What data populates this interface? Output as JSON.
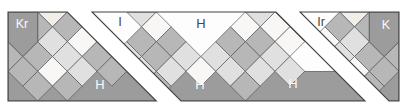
{
  "figure": {
    "width": 407,
    "height": 110,
    "strip": {
      "x": 8,
      "y": 12,
      "w": 391,
      "h": 89
    },
    "unit": 14.8333,
    "colors": {
      "dark": "#9c9c9c",
      "med": "#b7b7b7",
      "light": "#e0e0e0",
      "white": "#f8f7f5",
      "cream": "#f0eee6",
      "sky": "#fdfdfd",
      "cellStroke": "#54565a",
      "segStroke": "#404244",
      "labelLight": "#fafafa",
      "labelDark": "#474747"
    },
    "segments": [
      {
        "name": "segment-left",
        "clip": [
          [
            0,
            0
          ],
          [
            59.33,
            0
          ],
          [
            148.33,
            89
          ],
          [
            0,
            89
          ]
        ],
        "pentagons": [
          {
            "name": "corner-piece-Kr",
            "mirror": false,
            "pts": [
              [
                0,
                0
              ],
              [
                2,
                0
              ],
              [
                2,
                2
              ],
              [
                1,
                3
              ],
              [
                0,
                2
              ]
            ],
            "col": "dark"
          }
        ],
        "cells": [
          {
            "t": "tf",
            "c": 3,
            "r": 0,
            "col": "cream",
            "mirror": false
          },
          {
            "t": "tr",
            "c": 2,
            "r": 1,
            "col": "med",
            "mirror": false
          },
          {
            "t": "tr",
            "c": 0,
            "r": 3,
            "col": "med",
            "mirror": false
          },
          {
            "t": "d",
            "c": 4,
            "r": 1,
            "col": "med",
            "mirror": false
          },
          {
            "t": "d",
            "c": 3,
            "r": 2,
            "col": "light",
            "mirror": false
          },
          {
            "t": "d",
            "c": 5,
            "r": 2,
            "col": "white",
            "mirror": false
          },
          {
            "t": "d",
            "c": 2,
            "r": 3,
            "col": "med",
            "mirror": false
          },
          {
            "t": "d",
            "c": 4,
            "r": 3,
            "col": "light",
            "mirror": false
          },
          {
            "t": "d",
            "c": 6,
            "r": 3,
            "col": "med",
            "mirror": false
          },
          {
            "t": "d",
            "c": 1,
            "r": 4,
            "col": "med",
            "mirror": false
          },
          {
            "t": "d",
            "c": 3,
            "r": 4,
            "col": "white",
            "mirror": false
          },
          {
            "t": "d",
            "c": 5,
            "r": 4,
            "col": "light",
            "mirror": false
          },
          {
            "t": "d",
            "c": 7,
            "r": 4,
            "col": "med",
            "mirror": false
          },
          {
            "t": "d",
            "c": 2,
            "r": 5,
            "col": "med",
            "mirror": false
          },
          {
            "t": "d",
            "c": 4,
            "r": 5,
            "col": "med",
            "mirror": false
          }
        ]
      },
      {
        "name": "segment-middle",
        "clip": [
          [
            84,
            0
          ],
          [
            268,
            0
          ],
          [
            357,
            89
          ],
          [
            173,
            89
          ]
        ],
        "pentagons": [],
        "cells": [
          {
            "t": "tf",
            "c": 9,
            "r": 0,
            "col": "light",
            "mirror": false
          },
          {
            "t": "tf",
            "c": 17,
            "r": 0,
            "col": "light",
            "mirror": false
          },
          {
            "t": "d",
            "c": 10,
            "r": 1,
            "col": "white",
            "mirror": false
          },
          {
            "t": "d",
            "c": 16,
            "r": 1,
            "col": "white",
            "mirror": false
          },
          {
            "t": "d",
            "c": 18,
            "r": 1,
            "col": "white",
            "mirror": false
          },
          {
            "t": "d",
            "c": 9,
            "r": 2,
            "col": "med",
            "mirror": false
          },
          {
            "t": "d",
            "c": 11,
            "r": 2,
            "col": "med",
            "mirror": false
          },
          {
            "t": "d",
            "c": 15,
            "r": 2,
            "col": "med",
            "mirror": false
          },
          {
            "t": "d",
            "c": 17,
            "r": 2,
            "col": "med",
            "mirror": false
          },
          {
            "t": "d",
            "c": 19,
            "r": 2,
            "col": "white",
            "mirror": false
          },
          {
            "t": "d",
            "c": 8,
            "r": 3,
            "col": "light",
            "mirror": false
          },
          {
            "t": "d",
            "c": 10,
            "r": 3,
            "col": "med",
            "mirror": false
          },
          {
            "t": "d",
            "c": 12,
            "r": 3,
            "col": "light",
            "mirror": false
          },
          {
            "t": "d",
            "c": 14,
            "r": 3,
            "col": "light",
            "mirror": false
          },
          {
            "t": "d",
            "c": 16,
            "r": 3,
            "col": "med",
            "mirror": false
          },
          {
            "t": "d",
            "c": 18,
            "r": 3,
            "col": "light",
            "mirror": false
          },
          {
            "t": "d",
            "c": 9,
            "r": 4,
            "col": "light",
            "mirror": false
          },
          {
            "t": "d",
            "c": 11,
            "r": 4,
            "col": "light",
            "mirror": false
          },
          {
            "t": "d",
            "c": 13,
            "r": 4,
            "col": "white",
            "mirror": false
          },
          {
            "t": "d",
            "c": 15,
            "r": 4,
            "col": "light",
            "mirror": false
          },
          {
            "t": "d",
            "c": 17,
            "r": 4,
            "col": "light",
            "mirror": false
          },
          {
            "t": "d",
            "c": 19,
            "r": 4,
            "col": "light",
            "mirror": false
          },
          {
            "t": "d",
            "c": 10,
            "r": 5,
            "col": "med",
            "mirror": false
          },
          {
            "t": "d",
            "c": 16,
            "r": 5,
            "col": "med",
            "mirror": false
          }
        ]
      },
      {
        "name": "segment-right",
        "clip": [
          [
            292,
            0
          ],
          [
            391,
            0
          ],
          [
            391,
            89
          ],
          [
            381,
            89
          ]
        ],
        "pentagons": [
          {
            "name": "corner-piece-K",
            "mirror": true,
            "pts": [
              [
                0,
                0
              ],
              [
                2,
                0
              ],
              [
                2,
                2
              ],
              [
                1,
                3
              ],
              [
                0,
                2
              ]
            ],
            "col": "dark"
          }
        ],
        "cells": [
          {
            "t": "tf",
            "c": 3,
            "r": 0,
            "col": "cream",
            "mirror": true
          },
          {
            "t": "tr",
            "c": 2,
            "r": 1,
            "col": "med",
            "mirror": true
          },
          {
            "t": "tr",
            "c": 0,
            "r": 3,
            "col": "med",
            "mirror": true
          },
          {
            "t": "d",
            "c": 4,
            "r": 1,
            "col": "med",
            "mirror": true
          },
          {
            "t": "d",
            "c": 3,
            "r": 2,
            "col": "light",
            "mirror": true
          },
          {
            "t": "d",
            "c": 5,
            "r": 2,
            "col": "white",
            "mirror": true
          },
          {
            "t": "d",
            "c": 6,
            "r": 3,
            "col": "light",
            "mirror": true
          },
          {
            "t": "d",
            "c": 2,
            "r": 3,
            "col": "med",
            "mirror": true
          },
          {
            "t": "d",
            "c": 4,
            "r": 3,
            "col": "light",
            "mirror": true
          },
          {
            "t": "d",
            "c": 1,
            "r": 4,
            "col": "med",
            "mirror": true
          },
          {
            "t": "d",
            "c": 3,
            "r": 4,
            "col": "white",
            "mirror": true
          },
          {
            "t": "d",
            "c": 5,
            "r": 4,
            "col": "light",
            "mirror": true
          },
          {
            "t": "d",
            "c": 2,
            "r": 5,
            "col": "med",
            "mirror": true
          },
          {
            "t": "d",
            "c": 4,
            "r": 5,
            "col": "med",
            "mirror": true
          }
        ]
      }
    ],
    "labels": [
      {
        "name": "label-Kr",
        "text": "Kr",
        "x": 22,
        "y": 28,
        "col": "labelLight",
        "size": 12.5
      },
      {
        "name": "label-I",
        "text": "I",
        "x": 120,
        "y": 26,
        "col": "labelDark",
        "size": 13
      },
      {
        "name": "label-H-sky",
        "text": "H",
        "x": 201,
        "y": 28,
        "col": "labelDark",
        "size": 13
      },
      {
        "name": "label-Ir",
        "text": "Ir",
        "x": 321,
        "y": 26,
        "col": "labelDark",
        "size": 12.5
      },
      {
        "name": "label-K",
        "text": "K",
        "x": 386,
        "y": 29,
        "col": "labelLight",
        "size": 12.5
      },
      {
        "name": "label-H-ground-left",
        "text": "H",
        "x": 100,
        "y": 89,
        "col": "labelLight",
        "size": 13
      },
      {
        "name": "label-H-ground-middle",
        "text": "H",
        "x": 200,
        "y": 89,
        "col": "labelLight",
        "size": 13
      },
      {
        "name": "label-H-ground-right",
        "text": "H",
        "x": 293,
        "y": 88,
        "col": "labelLight",
        "size": 13
      }
    ]
  }
}
